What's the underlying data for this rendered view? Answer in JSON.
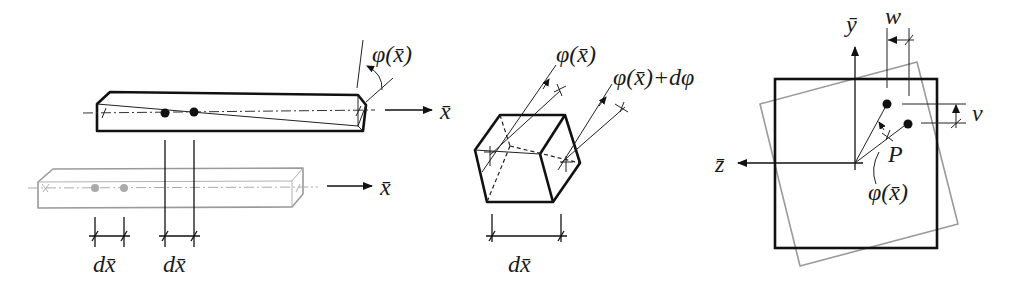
{
  "figure": {
    "panels": [
      {
        "id": "beam-twist",
        "labels": {
          "twist_angle": "φ(x̄)",
          "axis_top": "x̄",
          "axis_bottom": "x̄",
          "dx_left": "dx̄",
          "dx_right": "dx̄"
        }
      },
      {
        "id": "element",
        "labels": {
          "angle_left": "φ(x̄)",
          "angle_right": "φ(x̄)+dφ",
          "dx": "dx̄"
        }
      },
      {
        "id": "cross-section",
        "labels": {
          "y_axis": "ȳ",
          "z_axis": "z̄",
          "w": "w",
          "v": "v",
          "point": "P",
          "angle": "φ(x̄)"
        }
      }
    ],
    "colors": {
      "line": "#111111",
      "undeformed": "#9a9a9a",
      "background": "#ffffff"
    }
  }
}
